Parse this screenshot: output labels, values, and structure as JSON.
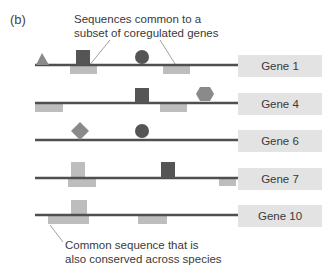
{
  "panel_label": "(b)",
  "annotations": {
    "top": [
      "Sequences common to a",
      "subset of coregulated genes"
    ],
    "bottom": [
      "Common sequence that is",
      "also conserved across species"
    ]
  },
  "colors": {
    "line": "#4f4f4f",
    "dark_shape": "#555555",
    "mid_shape": "#8a8a8a",
    "light_rect": "#bdbdbd",
    "gene_box": "#e3e3e3",
    "pointer": "#888888"
  },
  "genes": [
    {
      "label": "Gene 1",
      "line_y": 65,
      "box_top": 55
    },
    {
      "label": "Gene 4",
      "line_y": 103,
      "box_top": 93
    },
    {
      "label": "Gene 6",
      "line_y": 140,
      "box_top": 130
    },
    {
      "label": "Gene 7",
      "line_y": 178,
      "box_top": 168
    },
    {
      "label": "Gene 10",
      "line_y": 215,
      "box_top": 205
    }
  ]
}
